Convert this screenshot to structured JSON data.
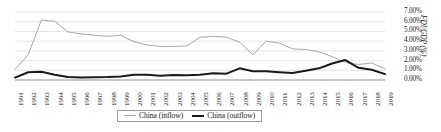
{
  "chart_data": {
    "type": "line",
    "title": "",
    "xlabel": "",
    "ylabel": "FDI/GDP (%)",
    "ylim": [
      0,
      7
    ],
    "ytick_values": [
      0,
      1,
      2,
      3,
      4,
      5,
      6,
      7
    ],
    "ytick_labels": [
      "0.00%",
      "1.00%",
      "2.00%",
      "3.00%",
      "4.00%",
      "5.00%",
      "6.00%",
      "7.00%"
    ],
    "grid": true,
    "legend_position": "bottom-center",
    "categories": [
      "1991",
      "1992",
      "1993",
      "1994",
      "1995",
      "1996",
      "1997",
      "1998",
      "1999",
      "2000",
      "2001",
      "2002",
      "2003",
      "2004",
      "2005",
      "2006",
      "2007",
      "2008",
      "2009",
      "2010",
      "2011",
      "2012",
      "2013",
      "2014",
      "2015",
      "2016",
      "2017",
      "2018",
      "2019"
    ],
    "series": [
      {
        "name": "China (inflow)",
        "color": "#a8a8a8",
        "width": 1,
        "values": [
          1.1,
          2.6,
          6.18,
          6.05,
          4.95,
          4.75,
          4.6,
          4.5,
          4.6,
          3.95,
          3.6,
          3.45,
          3.45,
          3.5,
          4.4,
          4.5,
          4.4,
          3.9,
          2.6,
          4.0,
          3.8,
          3.2,
          3.15,
          2.9,
          2.4,
          1.8,
          1.6,
          1.75,
          1.15
        ]
      },
      {
        "name": "China (outflow)",
        "color": "#1a1a1a",
        "width": 2,
        "values": [
          0.25,
          0.8,
          0.85,
          0.55,
          0.3,
          0.25,
          0.28,
          0.3,
          0.35,
          0.55,
          0.55,
          0.45,
          0.52,
          0.48,
          0.55,
          0.7,
          0.65,
          1.2,
          0.9,
          0.9,
          0.8,
          0.72,
          0.95,
          1.2,
          1.7,
          2.05,
          1.25,
          1.05,
          0.6
        ]
      }
    ]
  },
  "legend": {
    "entries": [
      {
        "label": "China (inflow)"
      },
      {
        "label": "China (outflow)"
      }
    ]
  }
}
